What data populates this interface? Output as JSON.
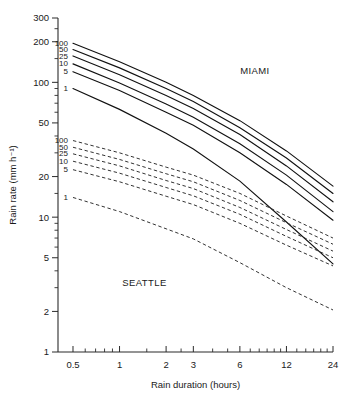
{
  "chart_data": {
    "type": "line",
    "title": "",
    "xlabel": "Rain duration (hours)",
    "ylabel": "Rain rate (mm h⁻¹)",
    "xscale": "log",
    "yscale": "log",
    "xlim": [
      0.4,
      24
    ],
    "ylim": [
      1,
      300
    ],
    "grid": false,
    "legend_position": "inline-labels",
    "xticks": [
      0.5,
      1,
      2,
      3,
      6,
      12,
      24
    ],
    "xticklabels": [
      "0.5",
      "1",
      "2",
      "3",
      "6",
      "12",
      "24"
    ],
    "yticks": [
      1,
      2,
      5,
      10,
      20,
      50,
      100,
      200,
      300
    ],
    "yticklabels": [
      "1",
      "2",
      "5",
      "10",
      "20",
      "50",
      "100",
      "200",
      "300"
    ],
    "annotations": [
      {
        "text": "MIAMI",
        "x": 7.5,
        "y": 115
      },
      {
        "text": "SEATTLE",
        "x": 1.45,
        "y": 3.1
      }
    ],
    "groups": [
      {
        "name": "MIAMI",
        "style": "solid",
        "label_anchor_x": 0.5,
        "series": [
          {
            "name": "100",
            "label": "100",
            "x": [
              0.5,
              1,
              2,
              3,
              6,
              12,
              24
            ],
            "values": [
              195,
              142,
              100,
              80,
              52,
              31,
              17
            ]
          },
          {
            "name": "50",
            "label": "50",
            "x": [
              0.5,
              1,
              2,
              3,
              6,
              12,
              24
            ],
            "values": [
              175,
              128,
              90,
              72,
              46,
              27.5,
              15
            ]
          },
          {
            "name": "25",
            "label": "25",
            "x": [
              0.5,
              1,
              2,
              3,
              6,
              12,
              24
            ],
            "values": [
              157,
              114,
              80,
              64,
              41,
              24,
              13
            ]
          },
          {
            "name": "10",
            "label": "10",
            "x": [
              0.5,
              1,
              2,
              3,
              6,
              12,
              24
            ],
            "values": [
              137,
              99,
              69,
              55,
              35,
              20.5,
              11
            ]
          },
          {
            "name": "5",
            "label": "5",
            "x": [
              0.5,
              1,
              2,
              3,
              6,
              12,
              24
            ],
            "values": [
              120,
              87,
              60,
              48,
              30,
              17.5,
              9.5
            ]
          },
          {
            "name": "1",
            "label": "1",
            "x": [
              0.5,
              1,
              2,
              3,
              6,
              12,
              24
            ],
            "values": [
              90,
              63,
              42,
              32,
              18.5,
              9.2,
              4.5
            ]
          }
        ]
      },
      {
        "name": "SEATTLE",
        "style": "dashed",
        "label_anchor_x": 0.5,
        "series": [
          {
            "name": "100",
            "label": "100",
            "x": [
              0.5,
              1,
              2,
              3,
              6,
              12,
              24
            ],
            "values": [
              37,
              30,
              23.5,
              20.5,
              15,
              10.2,
              7.0
            ]
          },
          {
            "name": "50",
            "label": "50",
            "x": [
              0.5,
              1,
              2,
              3,
              6,
              12,
              24
            ],
            "values": [
              33,
              26.8,
              21,
              18.3,
              13.3,
              9.1,
              6.3
            ]
          },
          {
            "name": "25",
            "label": "25",
            "x": [
              0.5,
              1,
              2,
              3,
              6,
              12,
              24
            ],
            "values": [
              29.5,
              24,
              18.7,
              16.3,
              11.8,
              8.1,
              5.6
            ]
          },
          {
            "name": "10",
            "label": "10",
            "x": [
              0.5,
              1,
              2,
              3,
              6,
              12,
              24
            ],
            "values": [
              26,
              21.2,
              16.6,
              14.4,
              10.5,
              7.2,
              5.0
            ]
          },
          {
            "name": "5",
            "label": "5",
            "x": [
              0.5,
              1,
              2,
              3,
              6,
              12,
              24
            ],
            "values": [
              22.5,
              18.3,
              14.3,
              12.4,
              9.0,
              6.2,
              4.35
            ]
          },
          {
            "name": "1",
            "label": "1",
            "x": [
              0.5,
              1,
              2,
              3,
              6,
              12,
              24
            ],
            "values": [
              14,
              11.0,
              8.2,
              6.9,
              4.6,
              3.0,
              2.05
            ]
          }
        ]
      }
    ]
  }
}
